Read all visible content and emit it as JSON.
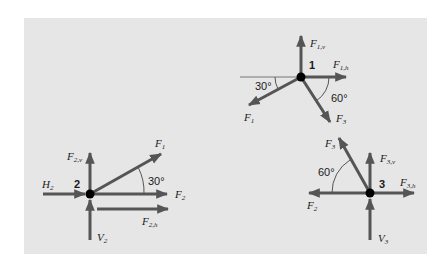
{
  "figure": {
    "background_color": "#e6e6e6",
    "arrow_color": "#555555",
    "node_color": "#000000"
  },
  "joints": [
    {
      "id": "1",
      "label": "1",
      "forces": [
        {
          "name": "F1v",
          "main": "F",
          "sub": "1,v",
          "direction": "up"
        },
        {
          "name": "F1h",
          "main": "F",
          "sub": "1,h",
          "direction": "right"
        },
        {
          "name": "F1",
          "main": "F",
          "sub": "1",
          "direction": "down-left at 30° below horizontal"
        },
        {
          "name": "F3",
          "main": "F",
          "sub": "3",
          "direction": "down-right at 60° below horizontal"
        }
      ],
      "angles": [
        "30°",
        "60°"
      ]
    },
    {
      "id": "2",
      "label": "2",
      "forces": [
        {
          "name": "F2v",
          "main": "F",
          "sub": "2,v",
          "direction": "up"
        },
        {
          "name": "H2",
          "main": "H",
          "sub": "2",
          "direction": "right (incoming)"
        },
        {
          "name": "F1",
          "main": "F",
          "sub": "1",
          "direction": "up-right at 30° above horizontal"
        },
        {
          "name": "F2",
          "main": "F",
          "sub": "2",
          "direction": "right"
        },
        {
          "name": "F2h",
          "main": "F",
          "sub": "2,h",
          "direction": "right (offset)"
        },
        {
          "name": "V2",
          "main": "V",
          "sub": "2",
          "direction": "up (incoming)"
        }
      ],
      "angles": [
        "30°"
      ]
    },
    {
      "id": "3",
      "label": "3",
      "forces": [
        {
          "name": "F3",
          "main": "F",
          "sub": "3",
          "direction": "up-left at 60° above horizontal"
        },
        {
          "name": "F3v",
          "main": "F",
          "sub": "3,v",
          "direction": "up"
        },
        {
          "name": "F3h",
          "main": "F",
          "sub": "3,h",
          "direction": "right"
        },
        {
          "name": "F2",
          "main": "F",
          "sub": "2",
          "direction": "left"
        },
        {
          "name": "V3",
          "main": "V",
          "sub": "3",
          "direction": "up (incoming)"
        }
      ],
      "angles": [
        "60°"
      ]
    }
  ],
  "text": {
    "j1": {
      "num": "1",
      "angle_a": "30°",
      "angle_b": "60°"
    },
    "j2": {
      "num": "2",
      "angle": "30°"
    },
    "j3": {
      "num": "3",
      "angle": "60°"
    },
    "F": "F",
    "H": "H",
    "V": "V",
    "s1v": "1,v",
    "s1h": "1,h",
    "s1": "1",
    "s3": "3",
    "s2v": "2,v",
    "s2": "2",
    "s2h": "2,h",
    "s3v": "3,v",
    "s3h": "3,h"
  }
}
